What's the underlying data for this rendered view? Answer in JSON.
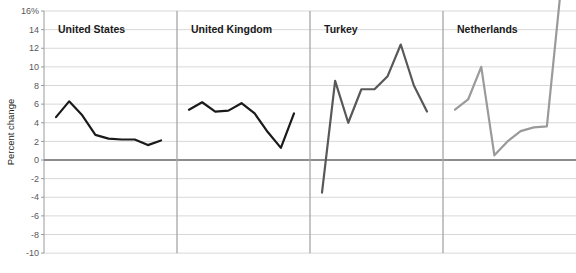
{
  "chart_data": {
    "type": "line",
    "title": "",
    "xlabel": "",
    "ylabel": "Percent change",
    "ylim": [
      -10,
      16
    ],
    "yticks": [
      16,
      14,
      12,
      10,
      8,
      6,
      4,
      2,
      0,
      -2,
      -4,
      -6,
      -8,
      -10
    ],
    "ytick_labels": [
      "16%",
      "14",
      "12",
      "10",
      "8",
      "6",
      "4",
      "2",
      "0",
      "-2",
      "-4",
      "-6",
      "-8",
      "-10"
    ],
    "grid": true,
    "legend": "none",
    "panels": [
      {
        "label": "United States",
        "color": "#1a1a1a",
        "x": [
          0,
          1,
          2,
          3,
          4,
          5,
          6,
          7,
          8
        ],
        "values": [
          4.6,
          6.3,
          4.8,
          2.7,
          2.3,
          2.2,
          2.2,
          1.6,
          2.1
        ]
      },
      {
        "label": "United Kingdom",
        "color": "#1a1a1a",
        "x": [
          0,
          1,
          2,
          3,
          4,
          5,
          6,
          7,
          8
        ],
        "values": [
          5.4,
          6.2,
          5.2,
          5.3,
          6.1,
          5.0,
          3.0,
          1.3,
          5.0
        ]
      },
      {
        "label": "Turkey",
        "color": "#58585b",
        "x": [
          0,
          1,
          2,
          3,
          4,
          5,
          6,
          7,
          8
        ],
        "values": [
          -3.5,
          8.5,
          4.0,
          7.6,
          7.6,
          9.0,
          12.4,
          8.0,
          5.2
        ]
      },
      {
        "label": "Netherlands",
        "color": "#9a9a9a",
        "x": [
          0,
          1,
          2,
          3,
          4,
          5,
          6,
          7,
          8
        ],
        "values": [
          5.4,
          6.5,
          10.0,
          0.5,
          2.0,
          3.1,
          3.5,
          3.6,
          17.5
        ]
      }
    ]
  },
  "axis": {
    "y_title": "Percent change"
  },
  "colors": {
    "grid": "#d8d8d8",
    "zero_line": "#6e6e6e",
    "divider": "#a6a6a6",
    "axis": "#9a9a9a",
    "series_dark": "#1a1a1a",
    "series_mid": "#58585b",
    "series_light": "#9a9a9a"
  }
}
